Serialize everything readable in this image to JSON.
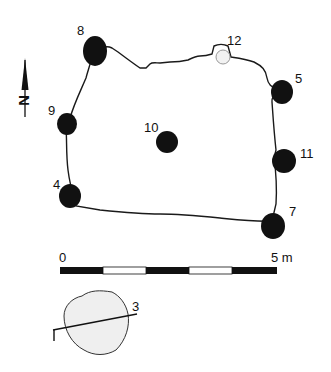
{
  "diagram": {
    "type": "archaeological-site-plan",
    "north_arrow": {
      "label": "N"
    },
    "posts": [
      {
        "id": "8",
        "label": "8",
        "fill": "#111111"
      },
      {
        "id": "12",
        "label": "12",
        "fill": "#eeeeee"
      },
      {
        "id": "5",
        "label": "5",
        "fill": "#111111"
      },
      {
        "id": "9",
        "label": "9",
        "fill": "#111111"
      },
      {
        "id": "10",
        "label": "10",
        "fill": "#111111"
      },
      {
        "id": "11",
        "label": "11",
        "fill": "#111111"
      },
      {
        "id": "4",
        "label": "4",
        "fill": "#111111"
      },
      {
        "id": "7",
        "label": "7",
        "fill": "#111111"
      }
    ],
    "scale_bar": {
      "start_label": "0",
      "end_label": "5 m",
      "segments": 5,
      "colors": [
        "#111111",
        "#ffffff",
        "#111111",
        "#ffffff",
        "#111111"
      ]
    },
    "section_feature": {
      "label": "3",
      "fill": "#eeeeee"
    }
  }
}
